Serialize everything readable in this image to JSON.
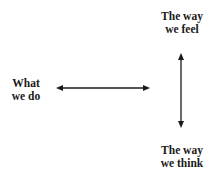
{
  "diagram": {
    "type": "concept-axes",
    "nodes": {
      "left": {
        "line1": "What",
        "line2": "we do"
      },
      "top": {
        "line1": "The way",
        "line2": "we feel"
      },
      "bottom": {
        "line1": "The way",
        "line2": "we think"
      }
    },
    "arrows": [
      {
        "name": "horizontal",
        "direction": "bidirectional",
        "from": [
          56,
          88
        ],
        "to": [
          150,
          88
        ]
      },
      {
        "name": "vertical",
        "direction": "bidirectional",
        "from": [
          181,
          53
        ],
        "to": [
          181,
          128
        ]
      }
    ],
    "colors": {
      "stroke": "#1a1a1a",
      "text": "#1a1a1a",
      "background": "#ffffff"
    }
  }
}
